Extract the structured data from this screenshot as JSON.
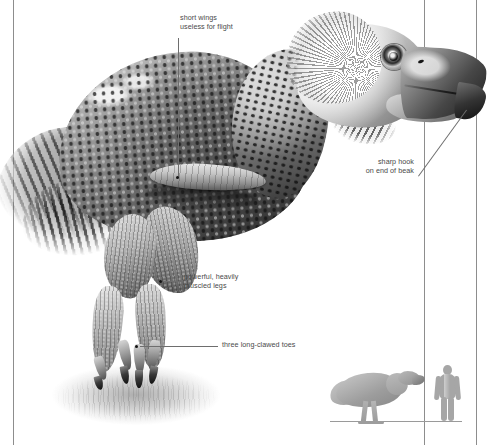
{
  "illustration": {
    "subject": "terror-bird",
    "style": "greyscale-scientific-illustration",
    "palette": {
      "background": "#ffffff",
      "rule": "#8d8d8d",
      "label_text": "#4a4a4a",
      "leader_line": "#6e6e6e",
      "leader_dot": "#131313",
      "silhouette_grey": "#a6a6a6"
    }
  },
  "annotations": [
    {
      "id": "wings",
      "text": "short wings\nuseless for flight",
      "align": "left",
      "target": "wing"
    },
    {
      "id": "beak",
      "text": "sharp hook\non end of beak",
      "align": "right",
      "target": "beak-tip"
    },
    {
      "id": "legs",
      "text": "powerful, heavily\nmuscled legs",
      "align": "left",
      "target": "upper-leg"
    },
    {
      "id": "toes",
      "text": "three long-clawed toes",
      "align": "left",
      "target": "foot-claws"
    }
  ],
  "scale_inset": {
    "bird_label": "terror-bird-silhouette",
    "human_label": "human-silhouette",
    "baseline_label": "ground-baseline"
  }
}
